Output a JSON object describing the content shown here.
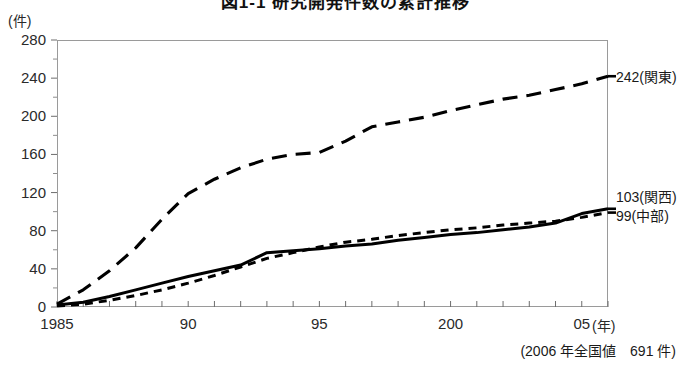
{
  "chart_data": {
    "type": "line",
    "title": "図1-1 研究開発件数の累計推移",
    "xlabel": "(年)",
    "ylabel": "(件)",
    "xlim": [
      1985,
      2006
    ],
    "ylim": [
      0,
      280
    ],
    "ytick_step": 40,
    "yminor_step": 20,
    "grid": false,
    "legend_position": "right-end-of-line",
    "x": [
      1985,
      1986,
      1987,
      1988,
      1989,
      1990,
      1991,
      1992,
      1993,
      1994,
      1995,
      1996,
      1997,
      1998,
      1999,
      2000,
      2001,
      2002,
      2003,
      2004,
      2005,
      2006
    ],
    "ytick_labels": [
      "0",
      "40",
      "80",
      "120",
      "160",
      "200",
      "240",
      "280"
    ],
    "ytick_values": [
      0,
      40,
      80,
      120,
      160,
      200,
      240,
      280
    ],
    "xtick_labels": [
      "1985",
      "90",
      "95",
      "200",
      "05"
    ],
    "xtick_values": [
      1985,
      1990,
      1995,
      2000,
      2005
    ],
    "series": [
      {
        "name": "関東",
        "style": "long-dash",
        "end_value": 242,
        "end_label": "242(関東)",
        "values": [
          3,
          18,
          38,
          62,
          92,
          119,
          134,
          146,
          155,
          160,
          162,
          174,
          189,
          194,
          199,
          206,
          212,
          218,
          222,
          228,
          234,
          242
        ]
      },
      {
        "name": "関西",
        "style": "solid",
        "end_value": 103,
        "end_label": "103(関西)",
        "values": [
          2,
          5,
          11,
          18,
          25,
          32,
          38,
          44,
          57,
          59,
          61,
          64,
          66,
          70,
          73,
          76,
          78,
          81,
          84,
          88,
          98,
          103
        ]
      },
      {
        "name": "中部",
        "style": "short-dash",
        "end_value": 99,
        "end_label": "99(中部)",
        "values": [
          1,
          3,
          7,
          12,
          18,
          25,
          33,
          42,
          51,
          57,
          63,
          68,
          71,
          75,
          78,
          81,
          83,
          86,
          88,
          90,
          94,
          99
        ]
      }
    ],
    "annotations": [
      {
        "name": "national-total-note",
        "text": "(2006 年全国値　691 件)"
      }
    ]
  }
}
